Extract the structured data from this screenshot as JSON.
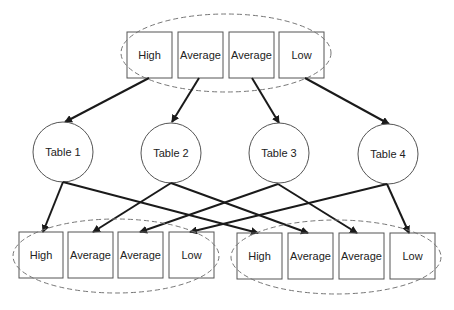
{
  "diagram": {
    "type": "mapping diagram",
    "colors": {
      "stroke": "#555555",
      "arrow": "#1a1a1a",
      "dashed": "#777777",
      "text": "#222222",
      "background": "#ffffff"
    },
    "top_group": {
      "boxes": [
        {
          "label": "High"
        },
        {
          "label": "Average"
        },
        {
          "label": "Average"
        },
        {
          "label": "Low"
        }
      ]
    },
    "tables": [
      {
        "label": "Table 1"
      },
      {
        "label": "Table 2"
      },
      {
        "label": "Table 3"
      },
      {
        "label": "Table 4"
      }
    ],
    "bottom_left_group": {
      "boxes": [
        {
          "label": "High"
        },
        {
          "label": "Average"
        },
        {
          "label": "Average"
        },
        {
          "label": "Low"
        }
      ]
    },
    "bottom_right_group": {
      "boxes": [
        {
          "label": "High"
        },
        {
          "label": "Average"
        },
        {
          "label": "Average"
        },
        {
          "label": "Low"
        }
      ]
    },
    "edges": [
      {
        "from": "top.High",
        "to": "Table 1"
      },
      {
        "from": "top.Average",
        "to": "Table 2"
      },
      {
        "from": "top.Average",
        "to": "Table 3"
      },
      {
        "from": "top.Low",
        "to": "Table 4"
      },
      {
        "from": "Table 1",
        "to": "bottom_left.High"
      },
      {
        "from": "Table 1",
        "to": "bottom_right.High"
      },
      {
        "from": "Table 2",
        "to": "bottom_left.Average"
      },
      {
        "from": "Table 2",
        "to": "bottom_right.Average"
      },
      {
        "from": "Table 3",
        "to": "bottom_left.Average"
      },
      {
        "from": "Table 3",
        "to": "bottom_right.Average"
      },
      {
        "from": "Table 4",
        "to": "bottom_left.Low"
      },
      {
        "from": "Table 4",
        "to": "bottom_right.Low"
      }
    ]
  }
}
